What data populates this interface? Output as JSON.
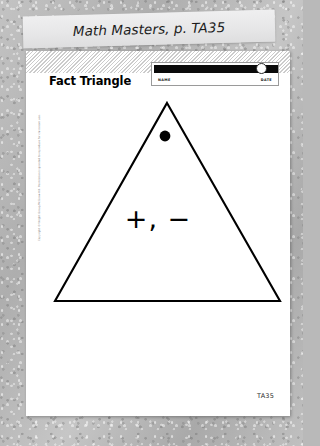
{
  "caption": {
    "text": "Math Masters, p. TA35"
  },
  "worksheet": {
    "title": "Fact Triangle",
    "name_date": {
      "name_label": "NAME",
      "date_label": "DATE"
    },
    "triangle": {
      "operators": "+, −",
      "dot_label": "corner-dot"
    },
    "copyright": "Copyright © Wright Group/McGraw-Hill. Permission is granted to reproduce for classroom use.",
    "page_code": "TA35"
  },
  "colors": {
    "ink": "#000000",
    "page": "#ffffff",
    "banner": "#e9e9ea",
    "backdrop": "#b5b5b5",
    "bar": "#0a0a0a"
  }
}
